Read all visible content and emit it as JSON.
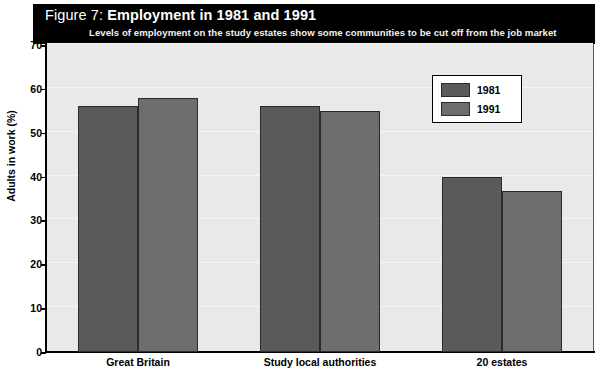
{
  "figure": {
    "label_prefix": "Figure 7:",
    "title": "Employment in 1981 and 1991",
    "subtitle": "Levels of employment on the study estates show some communities to be cut off from the job market"
  },
  "colors": {
    "banner_background": "#000000",
    "banner_text": "#ffffff",
    "plot_background": "#e9e9e7",
    "series_1981": "#5a5a5a",
    "series_1991": "#6d6d6d",
    "axis": "#000000",
    "gridline": "#f6f6f4"
  },
  "legend": {
    "position": "inside-top-right",
    "entries": [
      {
        "label": "1981",
        "color": "#5a5a5a"
      },
      {
        "label": "1991",
        "color": "#6d6d6d"
      }
    ]
  },
  "chart_data": {
    "type": "bar",
    "title": "Figure 7: Employment in 1981 and 1991",
    "subtitle": "Levels of employment on the study estates show some communities to be cut off from the job market",
    "xlabel": "",
    "ylabel": "Adults in work (%)",
    "ylim": [
      0,
      70
    ],
    "ytick_step": 10,
    "yticks": [
      0,
      10,
      20,
      30,
      40,
      50,
      60,
      70
    ],
    "ytick_labels": [
      "0",
      "10",
      "20",
      "30",
      "40",
      "50",
      "60",
      "70"
    ],
    "grid": true,
    "legend_position": "upper right",
    "categories": [
      "Great Britain",
      "Study local authorities",
      "20 estates"
    ],
    "series": [
      {
        "name": "1981",
        "color": "#5a5a5a",
        "values": [
          56,
          56,
          40
        ]
      },
      {
        "name": "1991",
        "color": "#6d6d6d",
        "values": [
          58,
          55,
          36.8
        ]
      }
    ]
  }
}
